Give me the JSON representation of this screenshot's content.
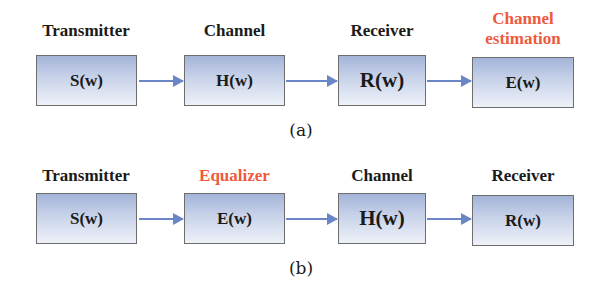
{
  "diagram_a": {
    "caption": "(a)",
    "blocks": [
      {
        "title": "Transmitter",
        "formula": "S(w)"
      },
      {
        "title": "Channel",
        "formula": "H(w)"
      },
      {
        "title": "Receiver",
        "formula": "R(w)"
      },
      {
        "title_line1": "Channel",
        "title_line2": "estimation",
        "formula": "E(w)",
        "title_color": "#ee5a3c"
      }
    ]
  },
  "diagram_b": {
    "caption": "(b)",
    "blocks": [
      {
        "title": "Transmitter",
        "formula": "S(w)"
      },
      {
        "title": "Equalizer",
        "formula": "E(w)",
        "title_color": "#ee5a3c"
      },
      {
        "title": "Channel",
        "formula": "H(w)"
      },
      {
        "title": "Receiver",
        "formula": "R(w)"
      }
    ]
  },
  "colors": {
    "highlight_text": "#ee5a3c",
    "arrow": "#6b86c6",
    "box_gradient_top": "#a3b4d8",
    "box_gradient_bottom": "#eef1f8",
    "box_border": "#6e6e6e"
  }
}
